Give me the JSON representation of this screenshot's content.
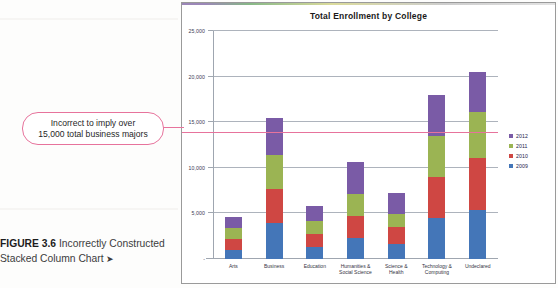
{
  "figure": {
    "caption_prefix": "FIGURE 3.6",
    "caption_text": " Incorrectly Constructed Stacked Column Chart ",
    "caption_arrow": "➤"
  },
  "callout": {
    "line1": "Incorrect to imply over",
    "line2": "15,000 total business majors",
    "color": "#e7739c"
  },
  "chart_data": {
    "type": "bar",
    "subtype": "stacked-column",
    "title": "Total Enrollment by College",
    "xlabel": "",
    "ylabel": "",
    "ylim": [
      0,
      25000
    ],
    "yticks": [
      0,
      5000,
      10000,
      15000,
      20000,
      25000
    ],
    "ytick_labels": [
      "-",
      "5,000",
      "10,000",
      "15,000",
      "20,000",
      "25,000"
    ],
    "grid": true,
    "legend_position": "right",
    "categories": [
      "Arts",
      "Business",
      "Education",
      "Humanities & Social Science",
      "Science & Health",
      "Technology & Computing",
      "Undeclared"
    ],
    "category_lines": [
      [
        "Arts"
      ],
      [
        "Business"
      ],
      [
        "Education"
      ],
      [
        "Humanities &",
        "Social Science"
      ],
      [
        "Science &",
        "Health"
      ],
      [
        "Technology &",
        "Computing"
      ],
      [
        "Undeclared"
      ]
    ],
    "series": [
      {
        "name": "2009",
        "color": "#4476b8",
        "values": [
          1000,
          4000,
          1350,
          2300,
          1600,
          4500,
          5400
        ]
      },
      {
        "name": "2010",
        "color": "#cf4743",
        "values": [
          1150,
          3700,
          1350,
          2400,
          1900,
          4500,
          5700
        ]
      },
      {
        "name": "2011",
        "color": "#9bb453",
        "values": [
          1250,
          3700,
          1450,
          2400,
          1400,
          4500,
          5000
        ]
      },
      {
        "name": "2012",
        "color": "#7a5ba6",
        "values": [
          1250,
          4100,
          1650,
          3500,
          2300,
          4500,
          4400
        ]
      }
    ],
    "totals": [
      4650,
      15500,
      5800,
      10600,
      7200,
      18000,
      20500
    ],
    "legend_order": [
      "2012",
      "2011",
      "2010",
      "2009"
    ],
    "annotation": {
      "reference_value": 13800,
      "reference_color": "#e7739c",
      "text": "Incorrect to imply over 15,000 total business majors"
    }
  }
}
